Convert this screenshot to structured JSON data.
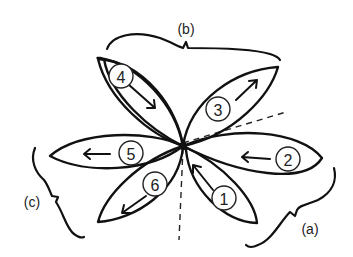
{
  "diagram": {
    "type": "petal-sequence-sketch",
    "center": [
      183,
      146
    ],
    "petals": [
      {
        "id": "1",
        "label": "1",
        "arrow_direction": "toward-center",
        "group": "a"
      },
      {
        "id": "2",
        "label": "2",
        "arrow_direction": "toward-center",
        "group": "a"
      },
      {
        "id": "3",
        "label": "3",
        "arrow_direction": "away-from-center",
        "group": "b"
      },
      {
        "id": "4",
        "label": "4",
        "arrow_direction": "toward-center",
        "group": "b"
      },
      {
        "id": "5",
        "label": "5",
        "arrow_direction": "away-from-center",
        "group": "c"
      },
      {
        "id": "6",
        "label": "6",
        "arrow_direction": "away-from-center",
        "group": "c"
      }
    ],
    "groups": [
      {
        "id": "a",
        "label": "(a)",
        "members": [
          "1",
          "2"
        ]
      },
      {
        "id": "b",
        "label": "(b)",
        "members": [
          "3",
          "4"
        ]
      },
      {
        "id": "c",
        "label": "(c)",
        "members": [
          "5",
          "6"
        ]
      }
    ],
    "guides": [
      {
        "style": "dashed",
        "direction": "vertical-down"
      },
      {
        "style": "dashed",
        "direction": "diagonal-up-right"
      }
    ],
    "colors": {
      "stroke": "#111111",
      "background": "#ffffff"
    }
  }
}
